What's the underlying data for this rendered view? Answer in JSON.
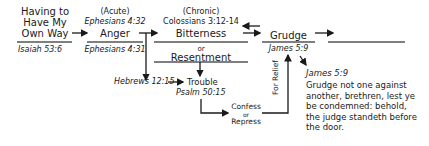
{
  "nodes": {
    "origin": {
      "line1": "Having to",
      "line2": "Have My",
      "line3": "Own Way",
      "ref": "Isaiah 53:6"
    },
    "anger": {
      "qualifier": "(Acute)",
      "ref_top": "Ephesians 4:32",
      "label": "Anger",
      "ref_bottom": "Ephesians 4:31"
    },
    "bitterness": {
      "qualifier": "(Chronic)",
      "ref_top": "Colossians 3:12-14",
      "label": "Bitterness",
      "or": "or",
      "alt_label": "Resentment"
    },
    "grudge": {
      "label": "Grudge",
      "ref": "James 5:9"
    },
    "hebrews": {
      "ref": "Hebrews 12:15"
    },
    "trouble": {
      "label": "Trouble",
      "ref": "Psalm 50:15"
    },
    "confess": {
      "line1": "Confess",
      "line2": "or",
      "line3": "Repress"
    },
    "relief": {
      "label": "For Relief"
    },
    "verse": {
      "ref": "James 5:9",
      "lines": [
        "Grudge not one against",
        "another, brethren, lest ye",
        "be condemned: behold,",
        "the judge standeth before",
        "the door."
      ]
    }
  },
  "colors": {
    "ink": "#1a1a1a",
    "line": "#555555"
  }
}
